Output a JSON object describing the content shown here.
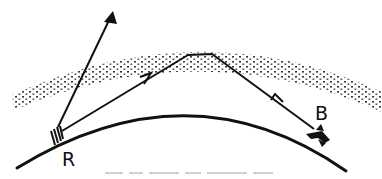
{
  "diagram": {
    "labels": {
      "receiver": "R",
      "transmitter": "B"
    },
    "elements": {
      "ground": "curved-earth-surface",
      "ionosphere": "dotted-reflecting-layer",
      "direct_ray": "ray-escaping-upward",
      "reflected_path": "skywave-path-B-to-R-via-ionosphere",
      "transmitter_icon": "aircraft-icon",
      "receiver_icon": "antenna-icon"
    },
    "colors": {
      "ink": "#111111",
      "caption": "#c8c8c8"
    }
  }
}
